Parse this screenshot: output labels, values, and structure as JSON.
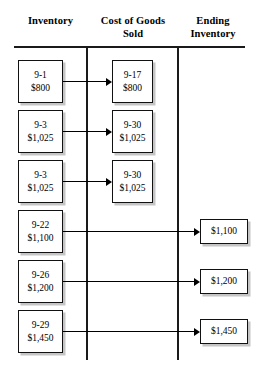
{
  "diagram": {
    "title_columns": {
      "inventory": "Inventory",
      "cogs_line1": "Cost of Goods",
      "cogs_line2": "Sold",
      "ending_line1": "Ending",
      "ending_line2": "Inventory"
    },
    "colors": {
      "line": "#1a1a1a",
      "box_border": "#111111",
      "background": "#ffffff",
      "shadow": "#969696"
    },
    "rows": [
      {
        "inventory": {
          "date": "9-1",
          "amount": "$800"
        },
        "cogs": {
          "date": "9-17",
          "amount": "$800"
        },
        "ending": null,
        "flow": "inventory-to-cogs"
      },
      {
        "inventory": {
          "date": "9-3",
          "amount": "$1,025"
        },
        "cogs": {
          "date": "9-30",
          "amount": "$1,025"
        },
        "ending": null,
        "flow": "inventory-to-cogs"
      },
      {
        "inventory": {
          "date": "9-3",
          "amount": "$1,025"
        },
        "cogs": {
          "date": "9-30",
          "amount": "$1,025"
        },
        "ending": null,
        "flow": "inventory-to-cogs"
      },
      {
        "inventory": {
          "date": "9-22",
          "amount": "$1,100"
        },
        "cogs": null,
        "ending": {
          "amount": "$1,100"
        },
        "flow": "inventory-to-ending"
      },
      {
        "inventory": {
          "date": "9-26",
          "amount": "$1,200"
        },
        "cogs": null,
        "ending": {
          "amount": "$1,200"
        },
        "flow": "inventory-to-ending"
      },
      {
        "inventory": {
          "date": "9-29",
          "amount": "$1,450"
        },
        "cogs": null,
        "ending": {
          "amount": "$1,450"
        },
        "flow": "inventory-to-ending"
      }
    ]
  }
}
